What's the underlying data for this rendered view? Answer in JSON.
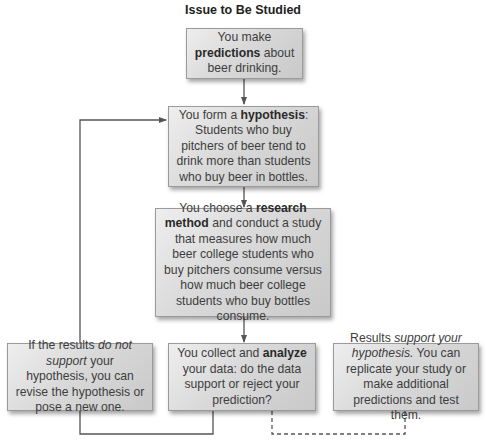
{
  "title": "Issue to Be Studied",
  "boxes": {
    "predictions": {
      "pre": "You make ",
      "bold": "predictions",
      "post": " about beer drinking."
    },
    "hypothesis": {
      "pre": "You form a ",
      "bold": "hypothesis",
      "post": ": Students who buy pitchers of beer tend to drink more than students who buy beer in bottles."
    },
    "research_method": {
      "pre": "You choose a ",
      "bold": "research method",
      "post": " and conduct a study that measures how much beer college students who buy pitchers consume versus how much beer college students who buy bottles consume."
    },
    "not_supported": {
      "pre": "If the results ",
      "italic": "do not support",
      "post": " your hypothesis, you can revise the hypothesis or pose a new one."
    },
    "analyze": {
      "pre": "You collect and ",
      "bold": "analyze",
      "post": " your data: do the data support or reject your prediction?"
    },
    "supported": {
      "pre": "Results ",
      "italic": "support your hypothesis.",
      "post": " You can replicate your study or make additional predictions and test them."
    }
  },
  "colors": {
    "line": "#555555",
    "box_border": "#9a9a9a"
  }
}
